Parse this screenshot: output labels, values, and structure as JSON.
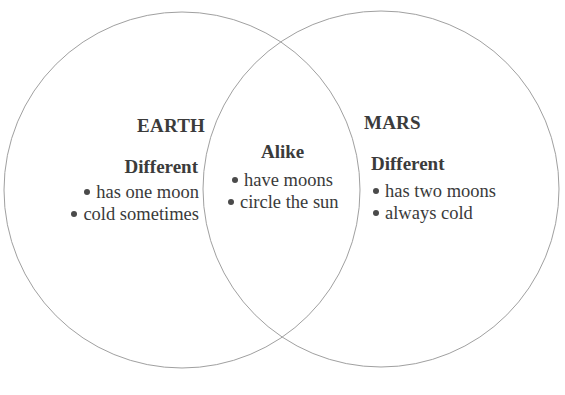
{
  "diagram": {
    "type": "venn",
    "circle_stroke": "#9a9a9a",
    "text_color": "#3a3a3a",
    "left_set": {
      "title": "EARTH",
      "section_heading": "Different",
      "items": [
        "has one moon",
        "cold sometimes"
      ]
    },
    "overlap": {
      "section_heading": "Alike",
      "items": [
        "have moons",
        "circle the sun"
      ]
    },
    "right_set": {
      "title": "MARS",
      "section_heading": "Different",
      "items": [
        "has two moons",
        "always cold"
      ]
    }
  }
}
